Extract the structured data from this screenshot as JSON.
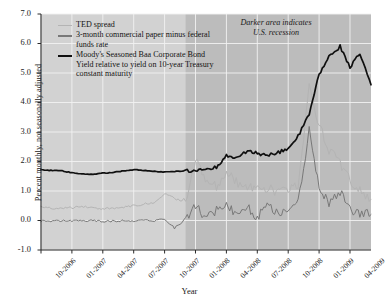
{
  "chart_data": {
    "type": "line",
    "title": "",
    "xlabel": "Year",
    "ylabel": "Percent monthly, not seasonally adjusted",
    "ylim": [
      -1.0,
      7.0
    ],
    "yticks": [
      "-1.0",
      "0.0",
      "1.0",
      "2.0",
      "3.0",
      "4.0",
      "5.0",
      "6.0",
      "7.0"
    ],
    "xticks": [
      "10-2006",
      "01-2007",
      "04-2007",
      "07-2007",
      "10-2007",
      "01-2008",
      "04-2008",
      "07-2008",
      "10-2008",
      "01-2009",
      "04-2009"
    ],
    "grid": true,
    "legend_position": "top-left",
    "annotation": "Darker area indicates U.S. recession",
    "plot_background": "#d2d2d2",
    "recession_background": "#bcbcbc",
    "recession_start": "12-2007",
    "recession_end": "06-2009",
    "x_start": "10-2006",
    "x_end": "06-2009",
    "series": [
      {
        "name": "TED spread",
        "color": "#b4b4b4",
        "width": 1.0,
        "x": [
          0.0,
          0.08,
          0.17,
          0.25,
          0.33,
          0.42,
          0.5,
          0.58,
          0.67,
          0.75,
          0.83,
          0.92,
          1.0,
          1.08,
          1.17,
          1.25,
          1.33,
          1.42,
          1.5,
          1.58,
          1.67,
          1.75,
          1.83,
          1.92,
          2.0,
          2.08,
          2.17,
          2.25,
          2.33,
          2.42,
          2.5,
          2.58,
          2.67
        ],
        "values": [
          0.45,
          0.42,
          0.4,
          0.44,
          0.47,
          0.43,
          0.4,
          0.42,
          0.46,
          0.5,
          0.55,
          0.62,
          0.92,
          0.75,
          0.62,
          2.08,
          1.45,
          1.15,
          1.62,
          1.3,
          1.05,
          1.2,
          1.1,
          0.95,
          1.05,
          1.22,
          4.58,
          3.25,
          2.4,
          1.95,
          1.35,
          1.02,
          0.72
        ]
      },
      {
        "name": "3-month commercial paper minus federal funds rate",
        "color": "#787878",
        "width": 1.0,
        "x": [
          0.0,
          0.08,
          0.17,
          0.25,
          0.33,
          0.42,
          0.5,
          0.58,
          0.67,
          0.75,
          0.83,
          0.92,
          1.0,
          1.08,
          1.17,
          1.25,
          1.33,
          1.42,
          1.5,
          1.58,
          1.67,
          1.75,
          1.83,
          1.92,
          2.0,
          2.08,
          2.17,
          2.25,
          2.33,
          2.42,
          2.5,
          2.58,
          2.67
        ],
        "values": [
          -0.02,
          -0.03,
          0.0,
          -0.02,
          -0.01,
          0.0,
          -0.03,
          -0.02,
          0.0,
          -0.01,
          0.02,
          0.0,
          0.05,
          -0.25,
          0.0,
          0.52,
          0.05,
          0.35,
          0.6,
          0.2,
          0.45,
          0.1,
          0.55,
          0.25,
          0.4,
          0.62,
          3.05,
          1.05,
          0.6,
          0.95,
          0.35,
          0.25,
          0.2
        ]
      },
      {
        "name": "Moody's Seasoned Baa Corporate Bond Yield relative to yield on 10-year Treasury constant maturity",
        "color": "#101010",
        "width": 1.7,
        "x": [
          0.0,
          0.08,
          0.17,
          0.25,
          0.33,
          0.42,
          0.5,
          0.58,
          0.67,
          0.75,
          0.83,
          0.92,
          1.0,
          1.08,
          1.17,
          1.25,
          1.33,
          1.42,
          1.5,
          1.58,
          1.67,
          1.75,
          1.83,
          1.92,
          2.0,
          2.08,
          2.17,
          2.25,
          2.33,
          2.42,
          2.5,
          2.58,
          2.67
        ],
        "values": [
          1.72,
          1.7,
          1.68,
          1.62,
          1.58,
          1.57,
          1.6,
          1.63,
          1.68,
          1.72,
          1.7,
          1.66,
          1.64,
          1.66,
          1.68,
          1.7,
          1.75,
          1.8,
          2.22,
          2.1,
          2.35,
          2.28,
          2.2,
          2.3,
          2.45,
          2.85,
          3.6,
          4.95,
          5.55,
          5.9,
          5.2,
          5.65,
          4.6
        ]
      }
    ]
  },
  "legend": {
    "items": [
      {
        "label": "TED spread"
      },
      {
        "label": "3-month commercial paper minus federal funds rate"
      },
      {
        "label": "Moody's Seasoned Baa Corporate Bond Yield relative to yield on 10-year Treasury constant maturity"
      }
    ]
  },
  "annotation": {
    "line1": "Darker area indicates",
    "line2": "U.S. recession"
  },
  "axes": {
    "x_title": "Year",
    "y_title": "Percent monthly, not seasonally adjusted"
  }
}
